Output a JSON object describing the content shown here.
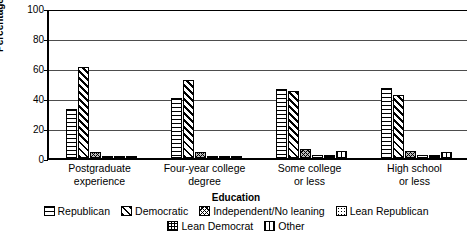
{
  "chart_data": {
    "type": "bar",
    "title": "",
    "xlabel": "Education",
    "ylabel": "Percentage",
    "ylim": [
      0,
      100
    ],
    "yticks": [
      0,
      20,
      40,
      60,
      80,
      100
    ],
    "grid": true,
    "legend_position": "bottom",
    "categories": [
      "Postgraduate experience",
      "Four-year college degree",
      "Some college or less",
      "High school or less"
    ],
    "category_lines": [
      [
        "Postgraduate",
        "experience"
      ],
      [
        "Four-year college",
        "degree"
      ],
      [
        "Some college",
        "or less"
      ],
      [
        "High school",
        "or less"
      ]
    ],
    "series": [
      {
        "name": "Republican",
        "pattern": "p-republican",
        "values": [
          33,
          40,
          46,
          47
        ]
      },
      {
        "name": "Democratic",
        "pattern": "p-democratic",
        "values": [
          61,
          52,
          45,
          42
        ]
      },
      {
        "name": "Independent/No leaning",
        "pattern": "p-independent",
        "values": [
          4,
          4,
          6,
          5
        ]
      },
      {
        "name": "Lean Republican",
        "pattern": "p-leanrep",
        "values": [
          1,
          1,
          2,
          2
        ]
      },
      {
        "name": "Lean Democrat",
        "pattern": "p-leandem",
        "values": [
          1,
          1,
          2,
          2
        ]
      },
      {
        "name": "Other",
        "pattern": "p-other",
        "values": [
          1,
          1,
          5,
          4
        ]
      }
    ]
  },
  "legend": {
    "row1": [
      "Republican",
      "Democratic",
      "Independent/No leaning",
      "Lean Republican"
    ],
    "row2": [
      "Lean Democrat",
      "Other"
    ]
  },
  "axis": {
    "y_title": "Percentage",
    "x_title": "Education",
    "ytick_labels": [
      "100",
      "80",
      "60",
      "40",
      "20",
      "0"
    ]
  }
}
